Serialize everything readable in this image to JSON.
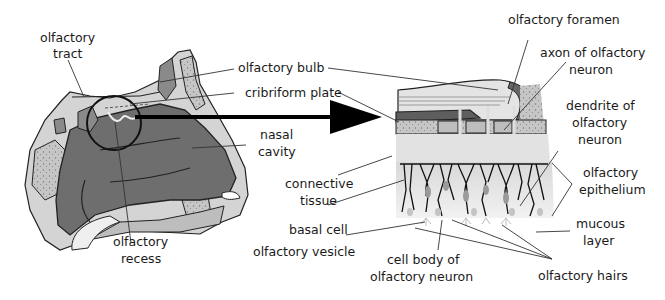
{
  "figure": {
    "left_panel": {
      "name": "sagittal section of nose",
      "labels": {
        "olfactory_tract_1": "olfactory",
        "olfactory_tract_2": "tract",
        "olfactory_bulb": "olfactory bulb",
        "cribriform_plate": "cribriform plate",
        "nasal_cavity_1": "nasal",
        "nasal_cavity_2": "cavity",
        "olfactory_recess_1": "olfactory",
        "olfactory_recess_2": "recess"
      }
    },
    "right_panel": {
      "name": "magnified olfactory region",
      "labels": {
        "olfactory_foramen": "olfactory foramen",
        "axon_1": "axon of olfactory",
        "axon_2": "neuron",
        "dendrite_1": "dendrite of",
        "dendrite_2": "olfactory",
        "dendrite_3": "neuron",
        "epithelium_1": "olfactory",
        "epithelium_2": "epithelium",
        "mucous_1": "mucous",
        "mucous_2": "layer",
        "connective_1": "connective",
        "connective_2": "tissue",
        "basal_cell": "basal cell",
        "olfactory_vesicle": "olfactory vesicle",
        "cell_body_1": "cell body of",
        "cell_body_2": "olfactory neuron",
        "olfactory_hairs": "olfactory hairs"
      }
    },
    "colors": {
      "cavity": "#6e6e6e",
      "bone_light": "#c9c9c9",
      "tissue_light": "#dcdcdc",
      "outline": "#222222",
      "arrow": "#000000"
    }
  }
}
